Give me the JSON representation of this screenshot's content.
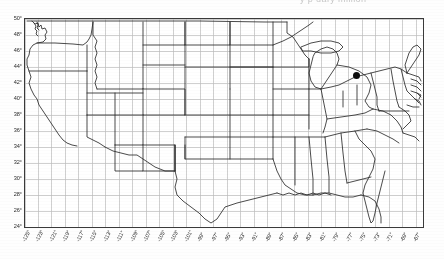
{
  "title_fragment": "y   p    uary  million",
  "chart_data": {
    "type": "scatter",
    "title": "",
    "subtitle": "",
    "xlabel": "",
    "ylabel": "",
    "basemap": "united-states-lower-48-state-boundaries",
    "projection": "equirectangular",
    "grid": true,
    "legend": "none",
    "xlim": [
      -125,
      -66
    ],
    "ylim": [
      24,
      50
    ],
    "x_tick_step": 2,
    "y_tick_step": 2,
    "y_ticks": [
      "50°",
      "48°",
      "46°",
      "44°",
      "42°",
      "40°",
      "38°",
      "36°",
      "34°",
      "32°",
      "30°",
      "28°",
      "26°",
      "24°"
    ],
    "y_values": [
      50,
      48,
      46,
      44,
      42,
      40,
      38,
      36,
      34,
      32,
      30,
      28,
      26,
      24
    ],
    "x_ticks": [
      "-125°",
      "-123°",
      "-121°",
      "-119°",
      "-117°",
      "-115°",
      "-113°",
      "-111°",
      "-109°",
      "-107°",
      "-105°",
      "-103°",
      "-101°",
      "-99°",
      "-97°",
      "-95°",
      "-93°",
      "-91°",
      "-89°",
      "-87°",
      "-85°",
      "-83°",
      "-81°",
      "-79°",
      "-77°",
      "-75°",
      "-73°",
      "-71°",
      "-69°",
      "-67°"
    ],
    "x_values": [
      -125,
      -123,
      -121,
      -119,
      -117,
      -115,
      -113,
      -111,
      -109,
      -107,
      -105,
      -103,
      -101,
      -99,
      -97,
      -95,
      -93,
      -91,
      -89,
      -87,
      -85,
      -83,
      -81,
      -79,
      -77,
      -75,
      -73,
      -71,
      -69,
      -67
    ],
    "series": [
      {
        "name": "site",
        "marker": "filled-circle",
        "color": "#0d0d0d",
        "points": [
          {
            "label": "",
            "lon": -75.9,
            "lat": 42.9
          }
        ]
      }
    ]
  },
  "colors": {
    "marker": "#0d0d0d",
    "frame": "#3a3a3a",
    "grid": "#b9b9b9",
    "coastline": "#2a2a2a",
    "background": "#ffffff"
  }
}
